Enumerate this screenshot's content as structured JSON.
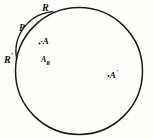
{
  "figure": {
    "background_color": "#fdfdfa",
    "stroke_color": "#1a1a1a",
    "label_color": "#111111",
    "canvas": {
      "width": 153,
      "height": 139
    },
    "main_circle": {
      "name": "outer-circle",
      "center_x": 79,
      "center_y": 71,
      "radius": 63.5,
      "stroke_width": 1.4
    },
    "inner_arc": {
      "name": "lens-arc",
      "description": "arc bulging to the right joining point R to point R-prime",
      "start_x": 53,
      "start_y": 12,
      "end_x": 17,
      "end_y": 59,
      "radius": 40,
      "sweep": 0
    },
    "labels": {
      "r_top": {
        "text": "R",
        "prime": "",
        "x": 42,
        "y": 1
      },
      "r_prime_left": {
        "text": "R",
        "prime": "'",
        "x": 4,
        "y": 53
      },
      "p_left": {
        "text": "P",
        "prime": "",
        "x": 19,
        "y": 24
      },
      "a_lens": {
        "dot": "·",
        "text": "A",
        "prime": "",
        "x": 40,
        "y": 37
      },
      "a_sub_r": {
        "text": "A",
        "subscript": "R",
        "x": 41,
        "y": 56
      },
      "a_prime_right": {
        "dot": "·",
        "text": "A",
        "prime": "'",
        "x": 107,
        "y": 69
      }
    },
    "points": [
      {
        "name": "point-A",
        "x": 45,
        "y": 44
      },
      {
        "name": "point-A-prime",
        "x": 110,
        "y": 76
      }
    ]
  }
}
